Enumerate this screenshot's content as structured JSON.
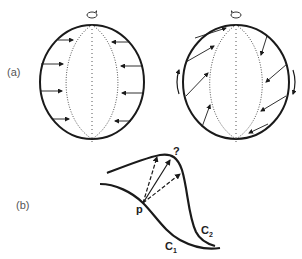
{
  "figure": {
    "panel_a": {
      "label": "(a)",
      "left_sphere": {
        "description": "sphere rotating, arrows pointing horizontally inward toward meridian",
        "rotation_symbol": "↻",
        "arrows": "horizontal inward"
      },
      "right_sphere": {
        "description": "sphere rotating, arrows slanted (sheared) toward meridian",
        "rotation_symbol": "↻",
        "side_arrows": [
          "up on left",
          "down on right"
        ]
      }
    },
    "panel_b": {
      "label": "(b)",
      "point_label": "p",
      "question_label": "?",
      "curve1_label": "C",
      "curve1_sub": "1",
      "curve2_label": "C",
      "curve2_sub": "2",
      "arrows": [
        "dashed",
        "solid",
        "dashed"
      ]
    },
    "colors": {
      "stroke": "#1a1a1a",
      "dotted": "#555555",
      "background": "#ffffff"
    }
  }
}
